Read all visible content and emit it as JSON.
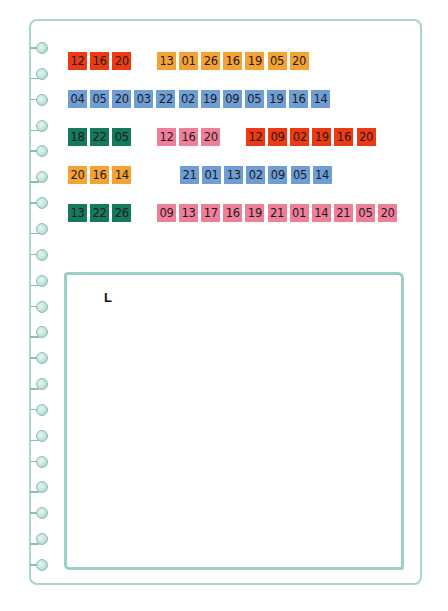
{
  "colors": {
    "red": "#ee3a12",
    "orange": "#f5a235",
    "blue": "#6f9ed6",
    "green": "#15795c",
    "pink": "#ef7f98",
    "page_border": "#a9d6cf",
    "ring": "#bfe3dc"
  },
  "notebook": {
    "ring_count": 21,
    "ring_icon": "binder-ring-icon"
  },
  "rows": [
    {
      "groups": [
        {
          "color": "red",
          "x": 68,
          "tiles": [
            "12",
            "16",
            "20"
          ]
        },
        {
          "color": "orange",
          "x": 157,
          "tiles": [
            "13",
            "01",
            "26",
            "16",
            "19",
            "05",
            "20"
          ]
        }
      ]
    },
    {
      "groups": [
        {
          "color": "blue",
          "x": 68,
          "tiles": [
            "04",
            "05",
            "20",
            "03",
            "22",
            "02",
            "19",
            "09",
            "05",
            "19",
            "16",
            "14"
          ]
        }
      ]
    },
    {
      "groups": [
        {
          "color": "green",
          "x": 68,
          "tiles": [
            "18",
            "22",
            "05"
          ]
        },
        {
          "color": "pink",
          "x": 157,
          "tiles": [
            "12",
            "16",
            "20"
          ]
        },
        {
          "color": "red",
          "x": 246,
          "tiles": [
            "12",
            "09",
            "02",
            "19",
            "16",
            "20"
          ]
        }
      ]
    },
    {
      "groups": [
        {
          "color": "orange",
          "x": 68,
          "tiles": [
            "20",
            "16",
            "14"
          ]
        },
        {
          "color": "blue",
          "x": 180,
          "tiles": [
            "21",
            "01",
            "13",
            "02",
            "09",
            "05",
            "14"
          ]
        }
      ]
    },
    {
      "groups": [
        {
          "color": "green",
          "x": 68,
          "tiles": [
            "13",
            "22",
            "26"
          ]
        },
        {
          "color": "pink",
          "x": 157,
          "tiles": [
            "09",
            "13",
            "17",
            "16",
            "19",
            "21",
            "01",
            "14",
            "21",
            "05",
            "20"
          ]
        }
      ]
    }
  ],
  "answer": {
    "text": "L"
  }
}
